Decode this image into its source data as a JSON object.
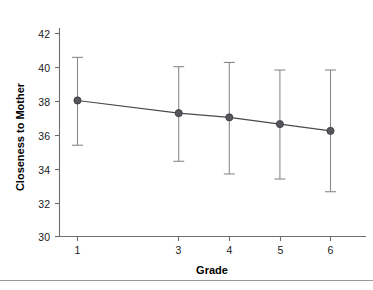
{
  "chart_data": {
    "type": "line",
    "title": "",
    "subtitle": "",
    "xlabel": "Grade",
    "ylabel": "Closeness to Mother",
    "x": [
      1,
      3,
      4,
      5,
      6
    ],
    "xticklabels": [
      "1",
      "3",
      "4",
      "5",
      "6"
    ],
    "yticklabels": [
      "30",
      "32",
      "34",
      "36",
      "38",
      "40",
      "42"
    ],
    "yticks": [
      30,
      32,
      34,
      36,
      38,
      40,
      42
    ],
    "xlim": [
      0.5,
      6.6
    ],
    "ylim": [
      30,
      42.6
    ],
    "grid": false,
    "legend": null,
    "series": [
      {
        "name": "Closeness to Mother",
        "values": [
          38.05,
          37.3,
          37.05,
          36.65,
          36.25
        ],
        "error_upper": [
          40.6,
          40.05,
          40.3,
          39.85,
          39.85
        ],
        "error_lower": [
          35.4,
          34.45,
          33.7,
          33.4,
          32.65
        ],
        "marker": "circle",
        "line_color": "#4a4a4a",
        "marker_color": "#55555c",
        "errorbar_color": "#8a8a8a"
      }
    ],
    "annotations": []
  },
  "axes": {
    "y_title": "Closeness to Mother",
    "x_title": "Grade"
  },
  "colors": {
    "axis": "#6e6e6e",
    "text": "#1a1a1a",
    "line": "#4a4a4a",
    "marker": "#55555c",
    "errorbar": "#8a8a8a",
    "footer_rule": "#9a9a9a",
    "background": "#ffffff"
  }
}
